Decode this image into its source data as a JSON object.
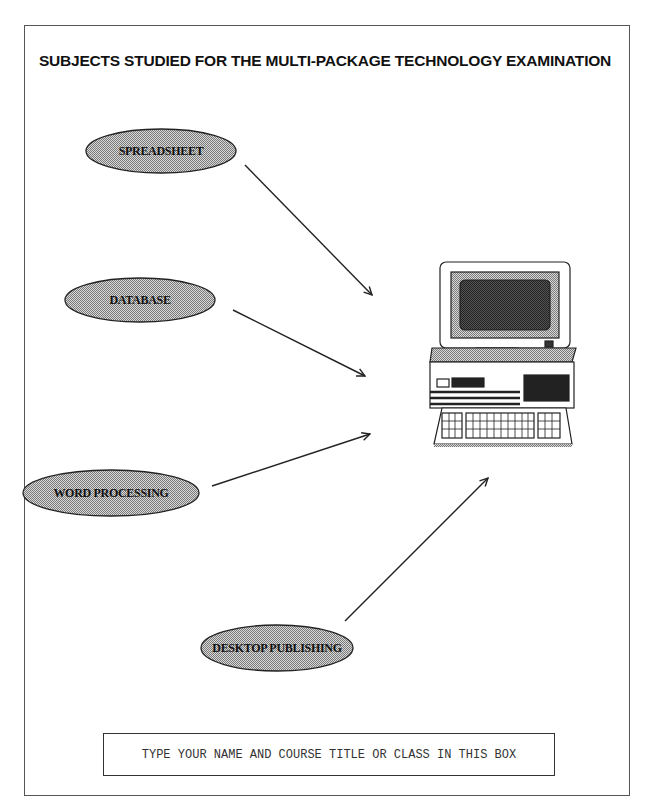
{
  "document": {
    "title": "SUBJECTS STUDIED FOR THE MULTI-PACKAGE TECHNOLOGY EXAMINATION",
    "subjects": [
      {
        "label": "SPREADSHEET"
      },
      {
        "label": "DATABASE"
      },
      {
        "label": "WORD PROCESSING"
      },
      {
        "label": "DESKTOP PUBLISHING"
      }
    ],
    "central_image": "computer-icon",
    "name_box": {
      "text": "TYPE YOUR NAME AND COURSE TITLE OR CLASS IN THIS BOX"
    },
    "colors": {
      "ellipse_fill": "#b4b4b4",
      "line": "#222222",
      "frame": "#555555"
    }
  }
}
